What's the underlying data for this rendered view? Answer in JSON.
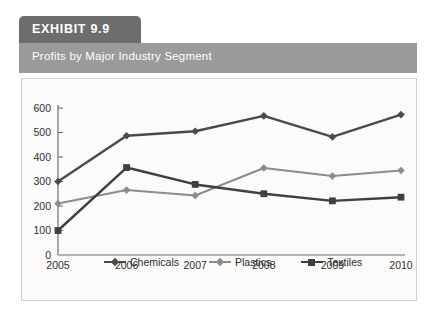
{
  "header": {
    "badge_label": "EXHIBIT 9.9",
    "subtitle": "Profits by Major Industry Segment",
    "badge_color": "#6d6d6d",
    "subtitle_bar_color": "#9a9a9a"
  },
  "chart_data": {
    "type": "line",
    "title": "Profits by Major Industry Segment",
    "xlabel": "",
    "ylabel": "",
    "categories": [
      "2005",
      "2006",
      "2007",
      "2008",
      "2009",
      "2010"
    ],
    "yticks": [
      0,
      100,
      200,
      300,
      400,
      500,
      600
    ],
    "ylim": [
      0,
      600
    ],
    "grid": false,
    "legend_position": "bottom",
    "series": [
      {
        "name": "Chemicals",
        "color": "#4a4a4a",
        "marker": "diamond",
        "values": [
          300,
          487,
          505,
          568,
          482,
          573
        ]
      },
      {
        "name": "Plastics",
        "color": "#8c8c8c",
        "marker": "diamond",
        "values": [
          210,
          265,
          243,
          355,
          322,
          345
        ]
      },
      {
        "name": "Textiles",
        "color": "#3f3f3f",
        "marker": "square",
        "values": [
          100,
          357,
          288,
          250,
          221,
          236
        ]
      }
    ]
  }
}
